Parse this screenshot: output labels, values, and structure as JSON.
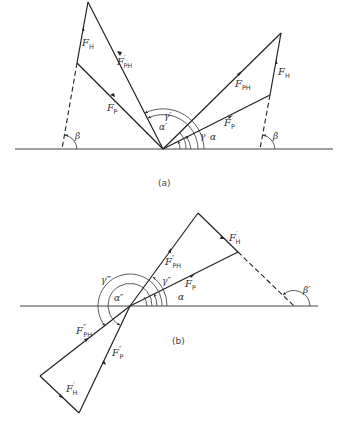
{
  "panels": [
    {
      "id": "a",
      "caption": "(a)",
      "labels": {
        "FH_left": "F",
        "FH_left_sub": "H",
        "FPH_prime": "F",
        "FPH_prime_sub": "PH",
        "FPH_prime_mark": "′",
        "FP_prime": "F",
        "FP_prime_sub": "P",
        "FP_prime_mark": "′",
        "FPH": "F",
        "FPH_sub": "PH",
        "FP": "F",
        "FP_sub": "P",
        "FH_right": "F",
        "FH_right_sub": "H",
        "beta_left": "β",
        "beta_right": "β",
        "gamma_prime": "γ′",
        "alpha_prime": "α′",
        "gamma": "γ",
        "alpha": "α"
      }
    },
    {
      "id": "b",
      "caption": "(b)",
      "labels": {
        "FPH_dprime": "F",
        "FPH_dprime_sub": "PH",
        "FPH_dprime_mark": "″",
        "FP": "F",
        "FP_sub": "P",
        "FH_prime_top": "F",
        "FH_prime_top_sub": "H",
        "FH_prime_top_mark": "′",
        "beta_prime": "β′",
        "gamma_dprime": "γ″",
        "alpha": "α",
        "gamma_tprime": "γ‴",
        "alpha_dprime": "α″",
        "FPH_tprime": "F",
        "FPH_tprime_sub": "PH",
        "FPH_tprime_mark": "‴",
        "FP_dprime": "F",
        "FP_dprime_sub": "P",
        "FP_dprime_mark": "″",
        "FH_prime_bottom": "F",
        "FH_prime_bottom_sub": "H",
        "FH_prime_bottom_mark": "′"
      }
    }
  ]
}
